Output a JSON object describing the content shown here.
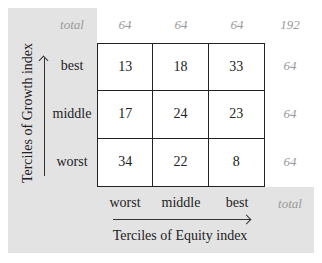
{
  "top_totals": {
    "label": "total",
    "values": [
      "64",
      "64",
      "64"
    ],
    "grand_total": "192"
  },
  "row_totals": [
    "64",
    "64",
    "64"
  ],
  "bottom_total_label": "total",
  "y_axis": {
    "title": "Terciles of Growth index",
    "labels": [
      "best",
      "middle",
      "worst"
    ]
  },
  "x_axis": {
    "title": "Terciles of Equity index",
    "labels": [
      "worst",
      "middle",
      "best"
    ]
  },
  "matrix": [
    [
      "13",
      "18",
      "33"
    ],
    [
      "17",
      "24",
      "23"
    ],
    [
      "34",
      "22",
      "8"
    ]
  ]
}
